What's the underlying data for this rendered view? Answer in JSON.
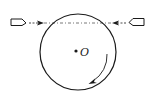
{
  "diagram": {
    "center_label": "O",
    "colors": {
      "stroke": "#1a1a1a",
      "dashed_line": "#555555",
      "background": "#ffffff"
    },
    "elements": {
      "disk": "rotating circular disk",
      "left_bullet": "bullet fired from left toward disk",
      "right_bullet": "bullet fired from right toward disk",
      "trajectory": "dashed horizontal line through bullets",
      "rotation": "clockwise rotation arrow"
    }
  }
}
